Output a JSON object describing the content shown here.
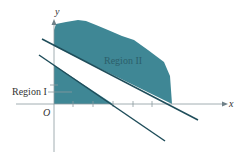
{
  "figure": {
    "axis_x_label": "x",
    "axis_y_label": "y",
    "origin_label": "O",
    "region_1_label": "Region I",
    "region_2_label": "Region II"
  },
  "colors": {
    "region_fill": "#3f8795",
    "region_text": "#2c5f6b",
    "line": "#1f4d5a",
    "axis": "#8a9aa0",
    "label": "#333333"
  }
}
